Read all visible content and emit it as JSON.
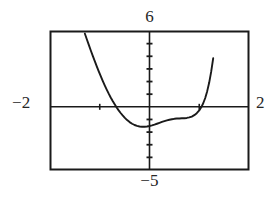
{
  "figure": {
    "kind": "graphing-calculator-window",
    "caption": "",
    "background_color": "#ffffff",
    "ink_color": "#1a1a1a"
  },
  "labels": {
    "ymax": "6",
    "ymin": "−5",
    "xmin": "−2",
    "xmax": "2"
  },
  "chart_data": {
    "type": "line",
    "title": "",
    "xlabel": "",
    "ylabel": "",
    "xlim": [
      -2,
      2
    ],
    "ylim": [
      -5,
      6
    ],
    "grid": false,
    "legend": null,
    "axis_tick_labels": {
      "left": "−2",
      "right": "2",
      "top": "6",
      "bottom": "−5"
    },
    "x_axis_position_y": 0,
    "y_axis_position_x": 0,
    "x_tick_spacing": 1,
    "y_tick_spacing": 1,
    "x_ticks": [
      -1,
      1
    ],
    "y_ticks": [
      -4,
      -3,
      -2,
      -1,
      1,
      2,
      3,
      4,
      5
    ],
    "series": [
      {
        "name": "curve",
        "style": "solid",
        "color": "#1a1a1a",
        "x": [
          -1.3,
          -1.26,
          -1.22,
          -1.18,
          -1.14,
          -1.1,
          -1.06,
          -1.02,
          -0.98,
          -0.94,
          -0.9,
          -0.86,
          -0.82,
          -0.78,
          -0.74,
          -0.7,
          -0.66,
          -0.62,
          -0.58,
          -0.54,
          -0.5,
          -0.45,
          -0.4,
          -0.35,
          -0.3,
          -0.25,
          -0.2,
          -0.15,
          -0.1,
          -0.05,
          0.0,
          0.05,
          0.1,
          0.15,
          0.2,
          0.25,
          0.3,
          0.35,
          0.4,
          0.45,
          0.5,
          0.55,
          0.6,
          0.65,
          0.7,
          0.75,
          0.8,
          0.85,
          0.9,
          0.95,
          1.0,
          1.04,
          1.08,
          1.12,
          1.16,
          1.2,
          1.24,
          1.28
        ],
        "y": [
          5.8,
          5.35,
          4.9,
          4.46,
          4.03,
          3.61,
          3.2,
          2.8,
          2.42,
          2.05,
          1.7,
          1.36,
          1.04,
          0.74,
          0.46,
          0.2,
          -0.05,
          -0.28,
          -0.49,
          -0.68,
          -0.86,
          -1.05,
          -1.21,
          -1.34,
          -1.44,
          -1.51,
          -1.56,
          -1.58,
          -1.58,
          -1.56,
          -1.52,
          -1.47,
          -1.41,
          -1.34,
          -1.27,
          -1.2,
          -1.13,
          -1.07,
          -1.02,
          -0.98,
          -0.95,
          -0.93,
          -0.92,
          -0.91,
          -0.9,
          -0.88,
          -0.84,
          -0.77,
          -0.66,
          -0.5,
          -0.28,
          -0.04,
          0.28,
          0.7,
          1.24,
          1.92,
          2.78,
          3.84
        ]
      }
    ]
  },
  "plot_geometry": {
    "frame": {
      "left": 50,
      "top": 31,
      "right": 249,
      "bottom": 170
    },
    "x_axis_y_px": 104,
    "y_axis_x_px": 150
  }
}
